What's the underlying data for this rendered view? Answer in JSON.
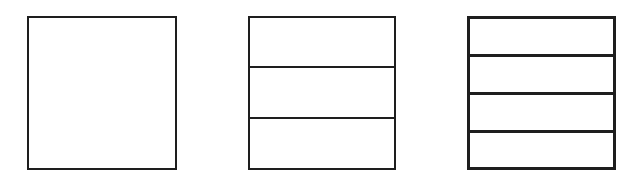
{
  "diagram": {
    "title": "",
    "stroke_color": "#1e1e1e",
    "background_color": "#ffffff",
    "boxes": [
      {
        "id": "box-1",
        "sections": 1,
        "x": 27,
        "y": 16,
        "width": 150,
        "height": 154,
        "dividers_y": []
      },
      {
        "id": "box-2",
        "sections": 3,
        "x": 248,
        "y": 16,
        "width": 148,
        "height": 154,
        "dividers_y": [
          67,
          118
        ]
      },
      {
        "id": "box-3",
        "sections": 4,
        "x": 467,
        "y": 16,
        "width": 149,
        "height": 154,
        "dividers_y": [
          55,
          93,
          131
        ]
      }
    ]
  }
}
